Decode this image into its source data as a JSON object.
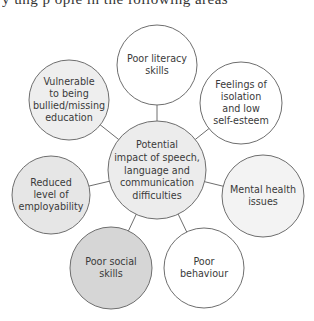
{
  "header": {
    "clipped_text": "y ung p ople in the following areas"
  },
  "diagram": {
    "stroke_color": "#6e6e6e",
    "connector_color": "#6e6e6e",
    "center": {
      "id": "center",
      "cx": 157,
      "cy": 170,
      "r": 49,
      "fill": "#ececec",
      "lines": [
        "Potential",
        "impact of speech,",
        "language and",
        "communication",
        "difficulties"
      ]
    },
    "nodes": [
      {
        "id": "poor-literacy-skills",
        "cx": 157,
        "cy": 65,
        "r": 40,
        "fill": "#ffffff",
        "lines": [
          "Poor literacy",
          "skills"
        ]
      },
      {
        "id": "feelings-of-isolation",
        "cx": 241,
        "cy": 103,
        "r": 41,
        "fill": "#ffffff",
        "lines": [
          "Feelings of",
          "isolation",
          "and low",
          "self-esteem"
        ]
      },
      {
        "id": "mental-health-issues",
        "cx": 263,
        "cy": 196,
        "r": 41,
        "fill": "#f3f3f3",
        "lines": [
          "Mental health",
          "issues"
        ]
      },
      {
        "id": "poor-behaviour",
        "cx": 204,
        "cy": 268,
        "r": 40,
        "fill": "#ffffff",
        "lines": [
          "Poor",
          "behaviour"
        ]
      },
      {
        "id": "poor-social-skills",
        "cx": 111,
        "cy": 268,
        "r": 41,
        "fill": "#d6d6d6",
        "lines": [
          "Poor social",
          "skills"
        ]
      },
      {
        "id": "reduced-employability",
        "cx": 51,
        "cy": 195,
        "r": 39,
        "fill": "#e6e6e6",
        "lines": [
          "Reduced",
          "level of",
          "employability"
        ]
      },
      {
        "id": "vulnerable-bullied",
        "cx": 69,
        "cy": 100,
        "r": 40,
        "fill": "#eeeeee",
        "lines": [
          "Vulnerable",
          "to being",
          "bullied/missing",
          "education"
        ]
      }
    ]
  }
}
